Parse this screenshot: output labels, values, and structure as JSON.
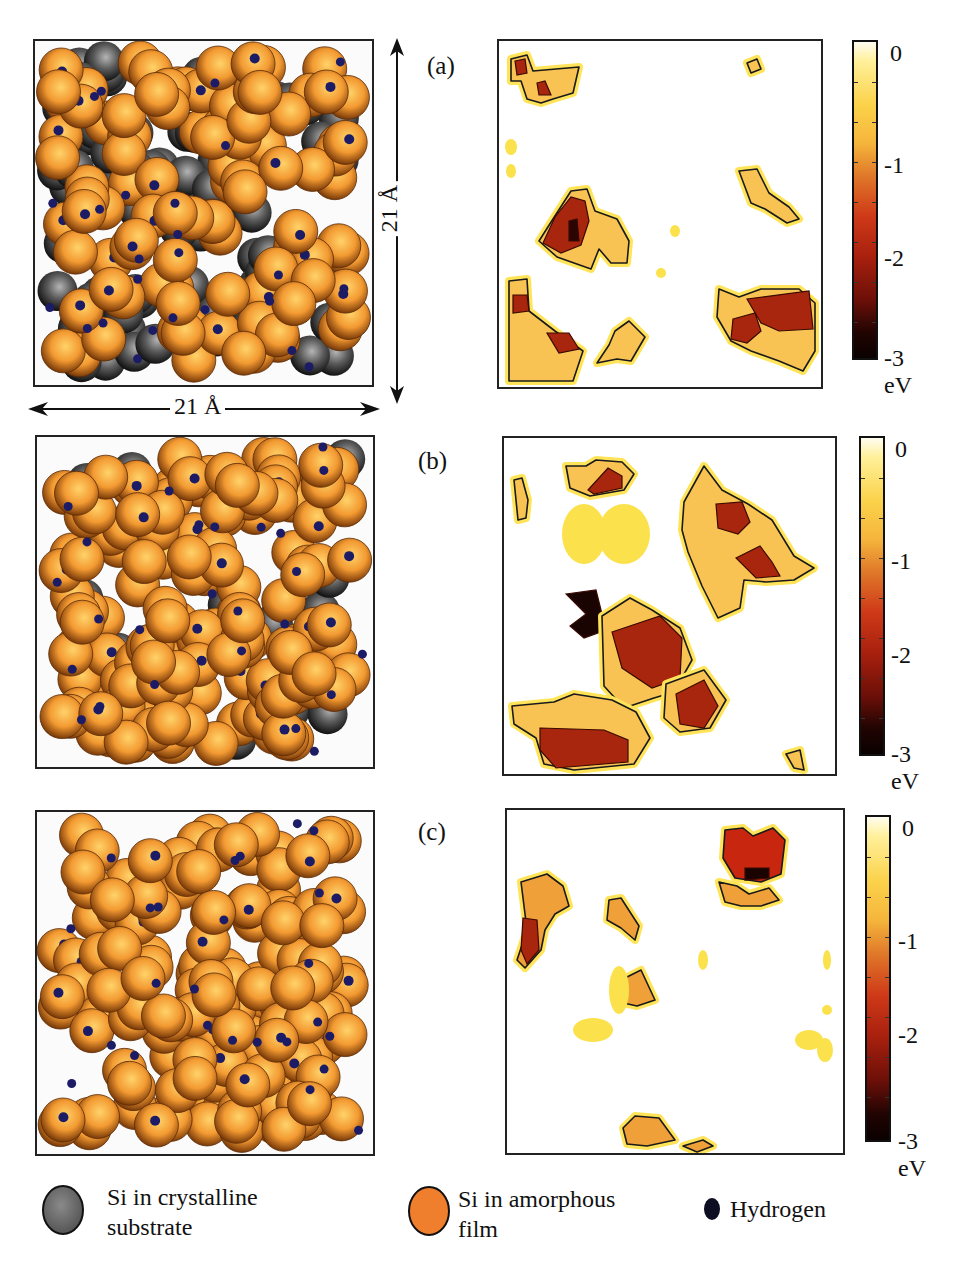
{
  "figure": {
    "panels": [
      {
        "id": "a",
        "label": "(a)"
      },
      {
        "id": "b",
        "label": "(b)"
      },
      {
        "id": "c",
        "label": "(c)"
      }
    ],
    "dimensions": {
      "horizontal": "21 Å",
      "vertical": "21 Å"
    },
    "colorbar": {
      "ticks": [
        "0",
        "-1",
        "-2",
        "-3"
      ],
      "unit": "eV",
      "range": [
        -3,
        0
      ],
      "colors": [
        "#fffdf0",
        "#fbd24a",
        "#cf3a18",
        "#6a0f08",
        "#0a0100"
      ]
    },
    "legend": [
      {
        "label_line1": "Si in crystalline",
        "label_line2": "substrate",
        "color": "#7a7a7a"
      },
      {
        "label_line1": "Si in amorphous",
        "label_line2": "film",
        "color": "#f08a2c"
      },
      {
        "label_line1": "Hydrogen",
        "label_line2": "",
        "color": "#15153a"
      }
    ],
    "colors": {
      "si_amorphous": "#f39a32",
      "si_crystalline": "#6e6e6e",
      "hydrogen": "#1c1c66",
      "contour_line": "#1a1a1a"
    }
  },
  "chart_data": [
    {
      "type": "heatmap",
      "title": "(a)",
      "xlabel": "",
      "ylabel": "",
      "extent_angstrom": [
        21,
        21
      ],
      "colorbar": {
        "label": "eV",
        "ticks": [
          0,
          -1,
          -2,
          -3
        ],
        "range": [
          -3,
          0
        ]
      },
      "regions": [
        {
          "location": "top-left",
          "min_energy_eV": -2.0
        },
        {
          "location": "center-left",
          "min_energy_eV": -3.0
        },
        {
          "location": "bottom-left",
          "min_energy_eV": -2.0
        },
        {
          "location": "bottom-right",
          "min_energy_eV": -2.0
        },
        {
          "location": "right-middle",
          "min_energy_eV": -1.0
        }
      ]
    },
    {
      "type": "heatmap",
      "title": "(b)",
      "xlabel": "",
      "ylabel": "",
      "extent_angstrom": [
        21,
        21
      ],
      "colorbar": {
        "label": "eV",
        "ticks": [
          0,
          -1,
          -2,
          -3
        ],
        "range": [
          -3,
          0
        ]
      },
      "regions": [
        {
          "location": "top-center",
          "min_energy_eV": -2.0
        },
        {
          "location": "top-right",
          "min_energy_eV": -2.0
        },
        {
          "location": "center",
          "min_energy_eV": -3.0
        },
        {
          "location": "bottom-left",
          "min_energy_eV": -2.0
        },
        {
          "location": "bottom-center",
          "min_energy_eV": -2.0
        }
      ]
    },
    {
      "type": "heatmap",
      "title": "(c)",
      "xlabel": "",
      "ylabel": "",
      "extent_angstrom": [
        21,
        21
      ],
      "colorbar": {
        "label": "eV",
        "ticks": [
          0,
          -1,
          -2,
          -3
        ],
        "range": [
          -3,
          0
        ]
      },
      "regions": [
        {
          "location": "top-right",
          "min_energy_eV": -2.5
        },
        {
          "location": "left",
          "min_energy_eV": -2.0
        },
        {
          "location": "center-left",
          "min_energy_eV": -1.2
        },
        {
          "location": "bottom-center",
          "min_energy_eV": -1.2
        }
      ]
    }
  ]
}
